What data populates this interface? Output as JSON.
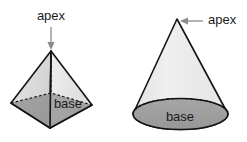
{
  "figure": {
    "background_color": "#ffffff",
    "width": 247,
    "height": 142
  },
  "colors": {
    "outline": "#141414",
    "leader": "#8a8a8a",
    "text": "#1a1a1a",
    "face_light": "#ececec",
    "face_mid": "#d8d8d8",
    "face_shadow": "#c2c2c2",
    "base_fill": "#a0a0a0",
    "base_fill_dark": "#949494"
  },
  "shapes": [
    {
      "id": "pyramid",
      "name": "square-pyramid",
      "apex_label": "apex",
      "base_label": "base",
      "faces": [
        "left-face",
        "right-face",
        "front-base-triangle"
      ],
      "hidden_edges": 2
    },
    {
      "id": "cone",
      "name": "cone",
      "apex_label": "apex",
      "base_label": "base",
      "faces": [
        "lateral-surface",
        "base-ellipse"
      ],
      "hidden_edges": 1
    }
  ],
  "labels": {
    "pyramid_apex": "apex",
    "pyramid_base": "base",
    "cone_apex": "apex",
    "cone_base": "base"
  },
  "annotations": {
    "pyramid_arrow_direction": "down",
    "cone_arrow_direction": "left"
  }
}
